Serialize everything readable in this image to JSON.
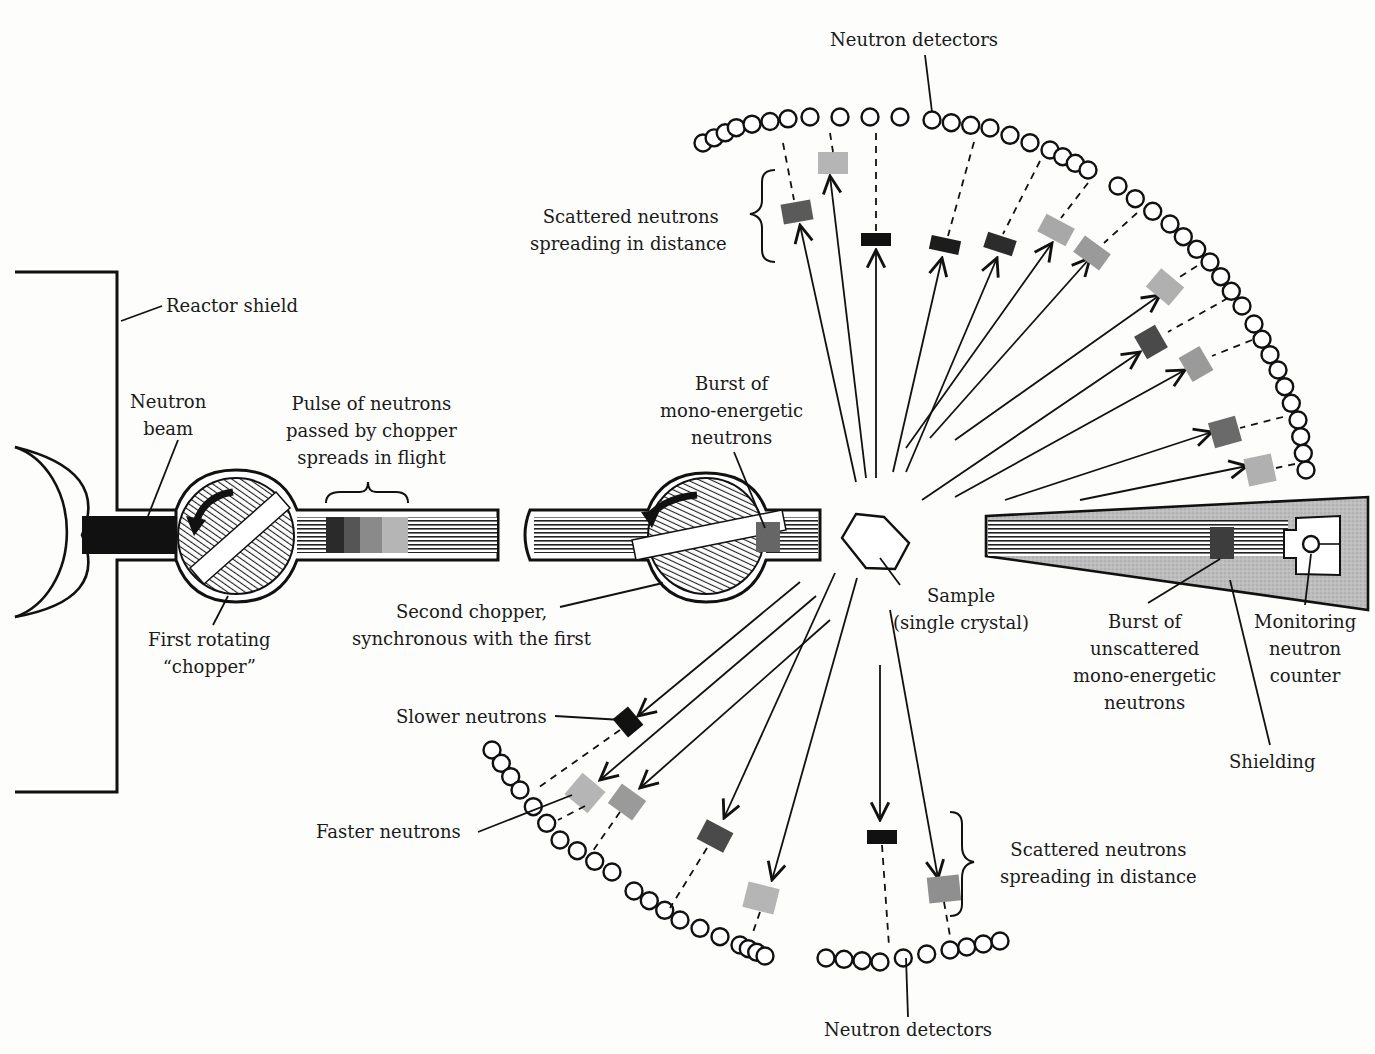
{
  "diagram": {
    "colors": {
      "ink": "#111111",
      "paper": "#fdfdfb",
      "pulse_dark": "#1c1c1c",
      "pulse_mid": "#5a5a5a",
      "pulse_light": "#a8a8a8",
      "shielding": "#b8b8b8"
    },
    "labels": {
      "reactor_shield": "Reactor shield",
      "neutron_beam": [
        "Neutron",
        "beam"
      ],
      "pulse_of_neutrons": [
        "Pulse of neutrons",
        "passed by chopper",
        "spreads in flight"
      ],
      "first_chopper": [
        "First rotating",
        "“chopper”"
      ],
      "second_chopper": [
        "Second chopper,",
        "synchronous with the first"
      ],
      "burst_mono": [
        "Burst of",
        "mono-energetic",
        "neutrons"
      ],
      "sample": [
        "Sample",
        "(single crystal)"
      ],
      "burst_unscattered": [
        "Burst of",
        "unscattered",
        "mono-energetic",
        "neutrons"
      ],
      "monitoring_counter": [
        "Monitoring",
        "neutron",
        "counter"
      ],
      "shielding": "Shielding",
      "neutron_detectors_top": "Neutron detectors",
      "neutron_detectors_bottom": "Neutron detectors",
      "scattered_top": [
        "Scattered neutrons",
        "spreading in distance"
      ],
      "scattered_bottom": [
        "Scattered neutrons",
        "spreading in distance"
      ],
      "slower_neutrons": "Slower neutrons",
      "faster_neutrons": "Faster neutrons"
    },
    "components": [
      {
        "name": "reactor",
        "type": "half-circle"
      },
      {
        "name": "reactor-shield",
        "type": "wall"
      },
      {
        "name": "first-chopper",
        "type": "rotating-disc",
        "rotation": "counter-clockwise"
      },
      {
        "name": "second-chopper",
        "type": "rotating-disc",
        "rotation": "counter-clockwise"
      },
      {
        "name": "sample",
        "type": "hexagon"
      },
      {
        "name": "monitor-housing",
        "type": "tapered-shield"
      },
      {
        "name": "upper-detector-arc",
        "type": "circle-array"
      },
      {
        "name": "lower-detector-arc",
        "type": "circle-array"
      }
    ]
  }
}
